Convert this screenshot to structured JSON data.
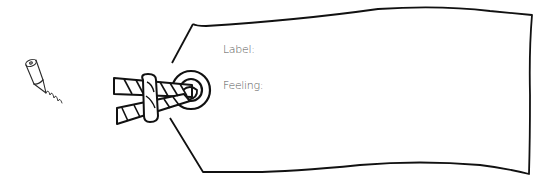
{
  "tag": {
    "fields": [
      {
        "label": "Label:",
        "value": ""
      },
      {
        "label": "Feeling:",
        "value": ""
      }
    ]
  },
  "icons": {
    "pencil": "pencil-icon",
    "tag": "luggage-tag-icon",
    "rope": "rope-knot-icon",
    "grommet": "grommet-ring-icon"
  },
  "colors": {
    "stroke": "#1a1a1a",
    "text": "#555555",
    "background": "#ffffff"
  }
}
